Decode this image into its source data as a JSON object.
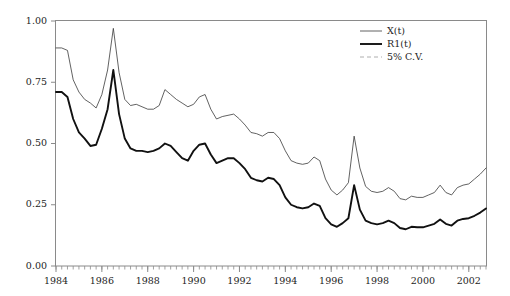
{
  "chart_data": {
    "type": "line",
    "title": "",
    "subtitle": "",
    "xlabel": "",
    "ylabel": "",
    "xlim": [
      1984.0,
      2002.75
    ],
    "ylim": [
      0.0,
      1.0
    ],
    "grid": false,
    "legend_position": "top-right",
    "x_major_ticks": [
      1984,
      1986,
      1988,
      1990,
      1992,
      1994,
      1996,
      1998,
      2000,
      2002
    ],
    "x_tick_labels": [
      "1984",
      "1986",
      "1988",
      "1990",
      "1992",
      "1994",
      "1996",
      "1998",
      "2000",
      "2002"
    ],
    "x_minor_tick_step": 0.25,
    "y_major_ticks": [
      0.0,
      0.25,
      0.5,
      0.75,
      1.0
    ],
    "y_tick_labels": [
      "0.00",
      "0.25",
      "0.50",
      "0.75",
      "1.00"
    ],
    "series": [
      {
        "name": "X(t)",
        "style": "solid-thin",
        "color": "#3a3a3a",
        "linewidth": 0.8,
        "x": [
          1984.0,
          1984.25,
          1984.5,
          1984.75,
          1985.0,
          1985.25,
          1985.5,
          1985.75,
          1986.0,
          1986.25,
          1986.5,
          1986.75,
          1987.0,
          1987.25,
          1987.5,
          1987.75,
          1988.0,
          1988.25,
          1988.5,
          1988.75,
          1989.0,
          1989.25,
          1989.5,
          1989.75,
          1990.0,
          1990.25,
          1990.5,
          1990.75,
          1991.0,
          1991.25,
          1991.5,
          1991.75,
          1992.0,
          1992.25,
          1992.5,
          1992.75,
          1993.0,
          1993.25,
          1993.5,
          1993.75,
          1994.0,
          1994.25,
          1994.5,
          1994.75,
          1995.0,
          1995.25,
          1995.5,
          1995.75,
          1996.0,
          1996.25,
          1996.5,
          1996.75,
          1997.0,
          1997.25,
          1997.5,
          1997.75,
          1998.0,
          1998.25,
          1998.5,
          1998.75,
          1999.0,
          1999.25,
          1999.5,
          1999.75,
          2000.0,
          2000.25,
          2000.5,
          2000.75,
          2001.0,
          2001.25,
          2001.5,
          2001.75,
          2002.0,
          2002.25,
          2002.5,
          2002.75
        ],
        "y": [
          0.89,
          0.89,
          0.88,
          0.76,
          0.71,
          0.68,
          0.665,
          0.645,
          0.7,
          0.8,
          0.97,
          0.79,
          0.68,
          0.655,
          0.66,
          0.65,
          0.64,
          0.64,
          0.655,
          0.72,
          0.7,
          0.68,
          0.665,
          0.65,
          0.66,
          0.69,
          0.7,
          0.64,
          0.6,
          0.61,
          0.615,
          0.62,
          0.6,
          0.575,
          0.545,
          0.54,
          0.53,
          0.545,
          0.545,
          0.52,
          0.47,
          0.43,
          0.42,
          0.415,
          0.42,
          0.445,
          0.43,
          0.355,
          0.31,
          0.29,
          0.31,
          0.34,
          0.53,
          0.4,
          0.325,
          0.305,
          0.3,
          0.305,
          0.32,
          0.305,
          0.275,
          0.27,
          0.285,
          0.28,
          0.28,
          0.29,
          0.3,
          0.33,
          0.3,
          0.29,
          0.32,
          0.33,
          0.335,
          0.355,
          0.375,
          0.4
        ]
      },
      {
        "name": "R1(t)",
        "style": "solid-thick",
        "color": "#111111",
        "linewidth": 1.9,
        "x": [
          1984.0,
          1984.25,
          1984.5,
          1984.75,
          1985.0,
          1985.25,
          1985.5,
          1985.75,
          1986.0,
          1986.25,
          1986.5,
          1986.75,
          1987.0,
          1987.25,
          1987.5,
          1987.75,
          1988.0,
          1988.25,
          1988.5,
          1988.75,
          1989.0,
          1989.25,
          1989.5,
          1989.75,
          1990.0,
          1990.25,
          1990.5,
          1990.75,
          1991.0,
          1991.25,
          1991.5,
          1991.75,
          1992.0,
          1992.25,
          1992.5,
          1992.75,
          1993.0,
          1993.25,
          1993.5,
          1993.75,
          1994.0,
          1994.25,
          1994.5,
          1994.75,
          1995.0,
          1995.25,
          1995.5,
          1995.75,
          1996.0,
          1996.25,
          1996.5,
          1996.75,
          1997.0,
          1997.25,
          1997.5,
          1997.75,
          1998.0,
          1998.25,
          1998.5,
          1998.75,
          1999.0,
          1999.25,
          1999.5,
          1999.75,
          2000.0,
          2000.25,
          2000.5,
          2000.75,
          2001.0,
          2001.25,
          2001.5,
          2001.75,
          2002.0,
          2002.25,
          2002.5,
          2002.75
        ],
        "y": [
          0.71,
          0.71,
          0.69,
          0.6,
          0.545,
          0.52,
          0.49,
          0.495,
          0.56,
          0.64,
          0.8,
          0.62,
          0.52,
          0.48,
          0.47,
          0.47,
          0.465,
          0.47,
          0.48,
          0.5,
          0.49,
          0.465,
          0.44,
          0.43,
          0.47,
          0.495,
          0.5,
          0.455,
          0.42,
          0.43,
          0.44,
          0.44,
          0.42,
          0.395,
          0.36,
          0.35,
          0.345,
          0.36,
          0.355,
          0.33,
          0.28,
          0.25,
          0.24,
          0.235,
          0.24,
          0.255,
          0.245,
          0.195,
          0.17,
          0.16,
          0.175,
          0.195,
          0.33,
          0.23,
          0.185,
          0.175,
          0.17,
          0.175,
          0.185,
          0.175,
          0.155,
          0.15,
          0.16,
          0.158,
          0.158,
          0.165,
          0.172,
          0.19,
          0.172,
          0.165,
          0.185,
          0.192,
          0.195,
          0.205,
          0.218,
          0.235
        ]
      },
      {
        "name": "5% C.V.",
        "style": "dashed",
        "color": "#999999",
        "linewidth": 0.8,
        "x": [],
        "y": []
      }
    ],
    "legend_entries": [
      {
        "label": "X(t)",
        "style": "solid-thin"
      },
      {
        "label": "R1(t)",
        "style": "solid-thick"
      },
      {
        "label": "5% C.V.",
        "style": "dashed"
      }
    ],
    "annotations": []
  },
  "colors": {
    "frame": "#8a8a8a",
    "series_thin": "#3a3a3a",
    "series_thick": "#111111",
    "series_dashed": "#999999",
    "background": "#ffffff",
    "text": "#1d1d1d"
  }
}
